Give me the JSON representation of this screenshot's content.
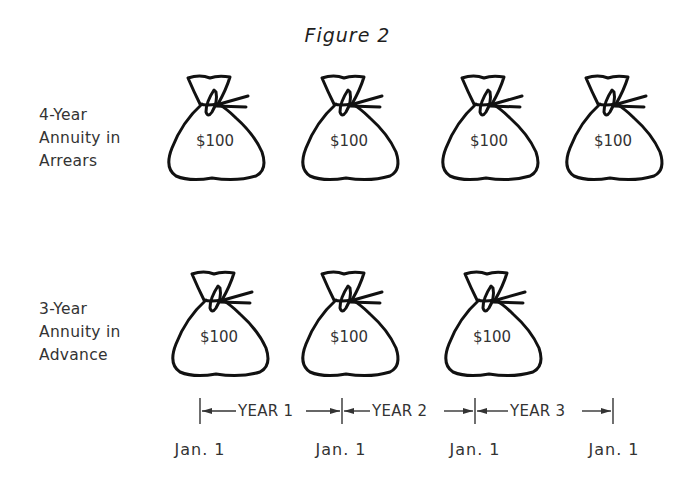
{
  "figure": {
    "title": "Figure 2"
  },
  "rows": [
    {
      "label_lines": [
        "4-Year",
        "Annuity in",
        "Arrears"
      ],
      "bags": [
        {
          "amount": "$100"
        },
        {
          "amount": "$100"
        },
        {
          "amount": "$100"
        },
        {
          "amount": "$100"
        }
      ]
    },
    {
      "label_lines": [
        "3-Year",
        "Annuity in",
        "Advance"
      ],
      "bags": [
        {
          "amount": "$100"
        },
        {
          "amount": "$100"
        },
        {
          "amount": "$100"
        }
      ]
    }
  ],
  "timeline": {
    "segments": [
      "YEAR 1",
      "YEAR 2",
      "YEAR 3"
    ],
    "dates": [
      "Jan. 1",
      "Jan. 1",
      "Jan. 1",
      "Jan. 1"
    ]
  },
  "icons": {
    "bag": "money-bag-icon",
    "arrow_left": "arrow-left-icon",
    "arrow_right": "arrow-right-icon"
  }
}
